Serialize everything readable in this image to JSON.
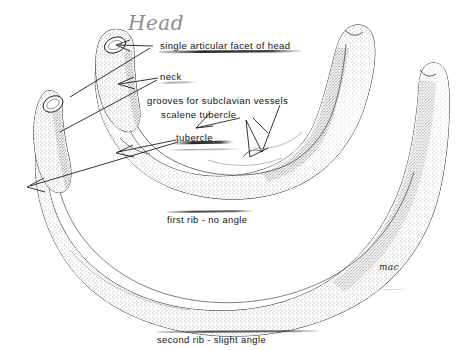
{
  "figure": {
    "background_color": "#ffffff",
    "ink_color": "#101010",
    "pencil_color": "#8d8d8d",
    "signature": "mac"
  },
  "handwritten_note": {
    "text": "Head"
  },
  "annotations": [
    {
      "id": "single-articular-facet-of-head",
      "label": "single articular facet of head"
    },
    {
      "id": "neck",
      "label": "neck"
    },
    {
      "id": "grooves-for-subclavian-vessels",
      "label": "grooves for subclavian vessels"
    },
    {
      "id": "scalene-tubercle",
      "label": "scalene tubercle"
    },
    {
      "id": "tubercle",
      "label": "tubercle"
    }
  ],
  "captions": [
    {
      "id": "first-rib",
      "label": "first rib - no angle"
    },
    {
      "id": "second-rib",
      "label": "second rib - slight angle"
    }
  ]
}
